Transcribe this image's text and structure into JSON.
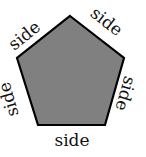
{
  "diagram": {
    "shape": "regular pentagon",
    "fill_color": "#808080",
    "stroke_color": "#000000",
    "vertices": [
      [
        70,
        16
      ],
      [
        124,
        58
      ],
      [
        105,
        125
      ],
      [
        38,
        125
      ],
      [
        17,
        58
      ]
    ],
    "labels": {
      "top_left": "side",
      "top_right": "side",
      "right": "side",
      "bottom": "side",
      "left": "side"
    }
  }
}
